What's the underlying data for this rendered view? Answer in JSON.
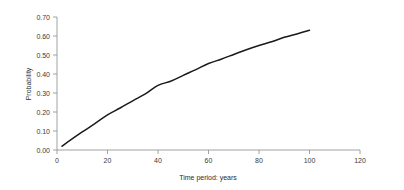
{
  "chart_data": {
    "type": "line",
    "title": "",
    "subtitle": "",
    "xlabel": "Time period: years",
    "ylabel": "Probability",
    "xlim": [
      0,
      120
    ],
    "ylim": [
      0.0,
      0.7
    ],
    "grid": false,
    "legend": null,
    "legend_position": "none",
    "x_ticks": [
      0,
      20,
      40,
      60,
      80,
      100,
      120
    ],
    "x_tick_labels": [
      "0",
      "20",
      "40",
      "60",
      "80",
      "100",
      "120"
    ],
    "y_ticks": [
      0.0,
      0.1,
      0.2,
      0.3,
      0.4,
      0.5,
      0.6,
      0.7
    ],
    "y_tick_labels": [
      "0.00",
      "0.10",
      "0.20",
      "0.30",
      "0.40",
      "0.50",
      "0.60",
      "0.70"
    ],
    "series": [
      {
        "name": "Probability",
        "color": "#1a1a1a",
        "x": [
          2,
          5,
          10,
          15,
          20,
          25,
          30,
          35,
          40,
          45,
          50,
          55,
          60,
          65,
          70,
          75,
          80,
          85,
          90,
          95,
          100
        ],
        "values": [
          0.02,
          0.049,
          0.095,
          0.139,
          0.185,
          0.221,
          0.259,
          0.295,
          0.34,
          0.362,
          0.393,
          0.423,
          0.455,
          0.478,
          0.503,
          0.528,
          0.55,
          0.57,
          0.593,
          0.611,
          0.63
        ]
      }
    ],
    "annotations": []
  },
  "colors": {
    "background": "#ffffff",
    "curve": "#1a1a1a",
    "axis": "#8a8a8a",
    "text": "#3a3a3a"
  }
}
